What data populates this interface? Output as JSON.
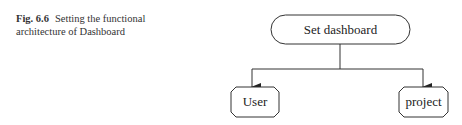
{
  "caption": {
    "label": "Fig. 6.6",
    "text": "Setting the functional architecture of Dashboard"
  },
  "diagram": {
    "root": {
      "label": "Set dashboard"
    },
    "children": [
      {
        "label": "User"
      },
      {
        "label": "project"
      }
    ]
  }
}
